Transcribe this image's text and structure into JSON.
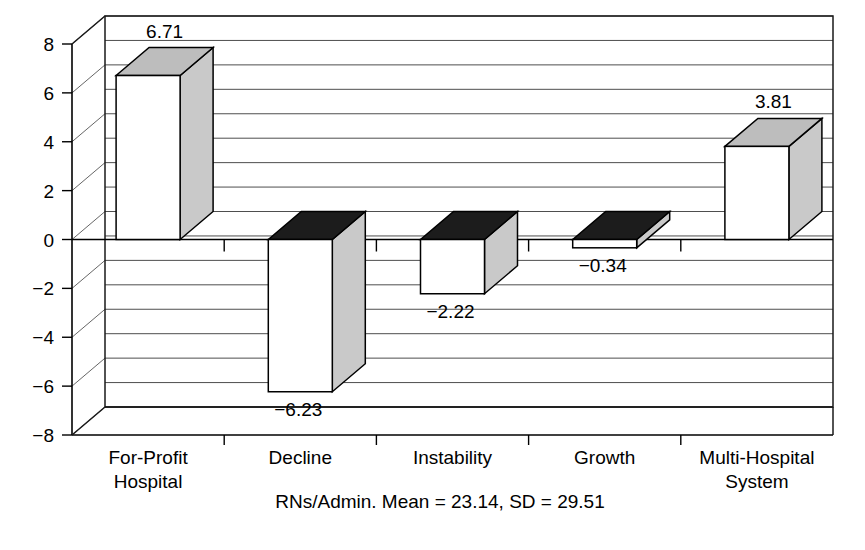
{
  "chart_data": {
    "type": "bar",
    "title": "",
    "subtitle": "",
    "xlabel": "",
    "ylabel": "",
    "caption": "RNs/Admin. Mean = 23.14, SD = 29.51",
    "categories": [
      "For-Profit Hospital",
      "Decline",
      "Instability",
      "Growth",
      "Multi-Hospital System"
    ],
    "category_lines": [
      [
        "For-Profit",
        "Hospital"
      ],
      [
        "Decline",
        ""
      ],
      [
        "Instability",
        ""
      ],
      [
        "Growth",
        ""
      ],
      [
        "Multi-Hospital",
        "System"
      ]
    ],
    "values": [
      6.71,
      -6.23,
      -2.22,
      -0.34,
      3.81
    ],
    "value_labels": [
      "6.71",
      "−6.23",
      "−2.22",
      "−0.34",
      "3.81"
    ],
    "ylim": [
      -8,
      8
    ],
    "ytick_values": [
      8,
      6,
      4,
      2,
      0,
      -2,
      -4,
      -6,
      -8
    ],
    "ytick_labels": [
      "8",
      "6",
      "4",
      "2",
      "0",
      "−2",
      "−4",
      "−6",
      "−8"
    ],
    "minor_grid_values": [
      7,
      5,
      3,
      1,
      -1,
      -3,
      -5,
      -7
    ],
    "grid": true,
    "legend": "none",
    "style": "3d-column",
    "colors": {
      "bar_front": "#ffffff",
      "bar_side": "#c9c9c9",
      "bar_top_positive": "#bdbdbd",
      "bar_top_negative": "#1c1c1c",
      "outline": "#000000",
      "gridline": "#3a3a3a",
      "background": "#ffffff"
    }
  }
}
